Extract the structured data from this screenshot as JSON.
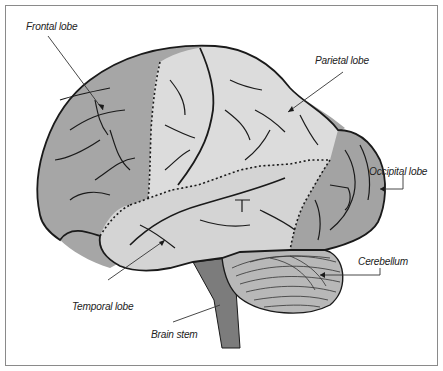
{
  "diagram": {
    "colors": {
      "frontal_lobe": "#a6a6a6",
      "parietal_lobe": "#dcdcdc",
      "temporal_lobe": "#d4d4d4",
      "occipital_lobe": "#a3a3a3",
      "cerebellum": "#b8b8b8",
      "brain_stem": "#7c7c7c",
      "outline": "#1a1a1a",
      "frame": "#8a8a8a"
    },
    "labels": [
      {
        "id": "frontal",
        "text": "Frontal lobe"
      },
      {
        "id": "parietal",
        "text": "Parietal lobe"
      },
      {
        "id": "occipital",
        "text": "Occipital lobe"
      },
      {
        "id": "cerebellum",
        "text": "Cerebellum"
      },
      {
        "id": "temporal",
        "text": "Temporal lobe"
      },
      {
        "id": "brainstem",
        "text": "Brain stem"
      }
    ]
  }
}
